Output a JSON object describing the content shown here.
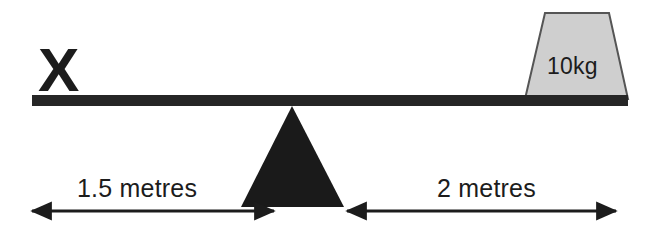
{
  "diagram": {
    "marker": {
      "label": "X",
      "name": "unknown-mass-marker"
    },
    "load": {
      "label": "10kg",
      "shape": "trapezoid-weight"
    },
    "dimensions": [
      {
        "id": "left-span",
        "label": "1.5 metres",
        "value": 1.5,
        "unit": "metres",
        "side": "left"
      },
      {
        "id": "right-span",
        "label": "2 metres",
        "value": 2,
        "unit": "metres",
        "side": "right"
      }
    ],
    "parts": {
      "beam": "lever-beam",
      "fulcrum": "triangular-fulcrum",
      "ground_line": "none"
    },
    "colors": {
      "ink": "#1c1c1c",
      "beam_fill": "#262626",
      "fulcrum_fill": "#1a1a1a",
      "weight_fill": "#cfcfcf",
      "weight_stroke": "#4a4a4a",
      "background": "#ffffff",
      "arrow": "#1c1c1c"
    }
  }
}
